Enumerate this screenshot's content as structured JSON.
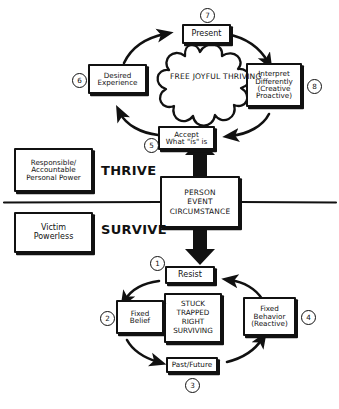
{
  "diagram": {
    "divider_label_upper": "THRIVE",
    "divider_label_lower": "SURVIVE",
    "colors": {
      "ink": "#111111",
      "paper": "#ffffff"
    }
  },
  "center": {
    "line1": "PERSON",
    "line2": "EVENT",
    "line3": "CIRCUMSTANCE"
  },
  "left_boxes": [
    {
      "name": "thrive-state",
      "line1": "Responsible/",
      "line2": "Accountable",
      "line3": "Personal Power"
    },
    {
      "name": "survive-state",
      "line1": "Victim",
      "line2": "Powerless",
      "line3": ""
    }
  ],
  "thrive_cycle": {
    "core_line1": "FREE",
    "core_line2": "JOYFUL",
    "core_line3": "THRIVING",
    "nodes": [
      {
        "num": "5",
        "line1": "Accept",
        "line2": "What \"is\" is",
        "line3": ""
      },
      {
        "num": "6",
        "line1": "Desired",
        "line2": "Experience",
        "line3": ""
      },
      {
        "num": "7",
        "line1": "Present",
        "line2": "",
        "line3": ""
      },
      {
        "num": "8",
        "line1": "Interpret",
        "line2": "Differently",
        "line3": "(Creative",
        "line4": "Proactive)"
      }
    ]
  },
  "survive_cycle": {
    "core_line1": "STUCK",
    "core_line2": "TRAPPED",
    "core_line3": "RIGHT",
    "core_line4": "SURVIVING",
    "nodes": [
      {
        "num": "1",
        "line1": "Resist",
        "line2": "",
        "line3": ""
      },
      {
        "num": "2",
        "line1": "Fixed",
        "line2": "Belief",
        "line3": ""
      },
      {
        "num": "3",
        "line1": "Past/Future",
        "line2": "",
        "line3": ""
      },
      {
        "num": "4",
        "line1": "Fixed",
        "line2": "Behavior",
        "line3": "(Reactive)"
      }
    ]
  }
}
